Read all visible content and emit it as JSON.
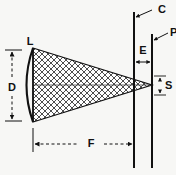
{
  "figure": {
    "type": "technical-line-diagram",
    "background_color": "#f7f7f5",
    "ink_color": "#111111",
    "hatch_color": "#3a3a3a"
  },
  "labels": {
    "lens": "L",
    "diameter": "D",
    "focal_distance": "F",
    "condenser_plane": "C",
    "projection_plane": "P",
    "plane_separation": "E",
    "spot_size": "S"
  },
  "elements": {
    "lens": {
      "name": "L",
      "description": "plano-convex lens, curved left face, flat right face",
      "x": 33,
      "top_y": 48,
      "bottom_y": 122,
      "bulge": 12
    },
    "cone": {
      "description": "hatched converging beam from lens aperture to focal point",
      "base_x": 33,
      "base_top_y": 48,
      "base_bottom_y": 122,
      "apex_x": 152,
      "apex_y": 85,
      "fill": "crosshatch-diamond"
    },
    "axis": {
      "description": "horizontal optical centerline",
      "y": 85,
      "x_start": 33,
      "x_end": 152
    },
    "line_c": {
      "label": "C",
      "x": 134,
      "y_top": 12,
      "y_bottom": 168
    },
    "line_p": {
      "label": "P",
      "x": 152,
      "y_top": 34,
      "y_bottom": 168
    }
  },
  "dimensions": [
    {
      "label": "D",
      "orientation": "vertical",
      "style": "dashed-double-arrow",
      "x": 12,
      "from_y": 50,
      "to_y": 121,
      "label_x": 12,
      "label_y": 88
    },
    {
      "label": "F",
      "orientation": "horizontal",
      "style": "dashed-double-arrow",
      "y": 144,
      "from_x": 33,
      "to_x": 134,
      "label_x": 93,
      "label_y": 143
    },
    {
      "label": "E",
      "orientation": "horizontal",
      "style": "short-double-arrow",
      "y": 62,
      "from_x": 134,
      "to_x": 152,
      "label_x": 143,
      "label_y": 50
    },
    {
      "label": "S",
      "orientation": "vertical",
      "style": "short-double-arrow",
      "x": 159,
      "from_y": 76,
      "to_y": 95,
      "label_x": 166,
      "label_y": 86
    }
  ],
  "leaders": [
    {
      "label": "C",
      "label_x": 161,
      "label_y": 10,
      "tip_x": 136,
      "tip_y": 16
    },
    {
      "label": "P",
      "label_x": 170,
      "label_y": 34,
      "tip_x": 154,
      "tip_y": 39
    },
    {
      "label": "L",
      "label_x": 30,
      "label_y": 42
    }
  ]
}
